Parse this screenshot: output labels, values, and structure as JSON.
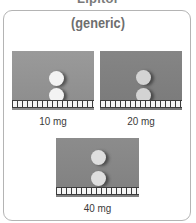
{
  "header": {
    "clipped_title": "Lipitor"
  },
  "card": {
    "title": "(generic)",
    "tablets": [
      {
        "label": "10 mg",
        "pill_color": "#f2f2f2",
        "bg": "light"
      },
      {
        "label": "20 mg",
        "pill_color": "#d2d2d2",
        "bg": "dark"
      },
      {
        "label": "40 mg",
        "pill_color": "#dedede",
        "bg": "mid"
      }
    ]
  }
}
